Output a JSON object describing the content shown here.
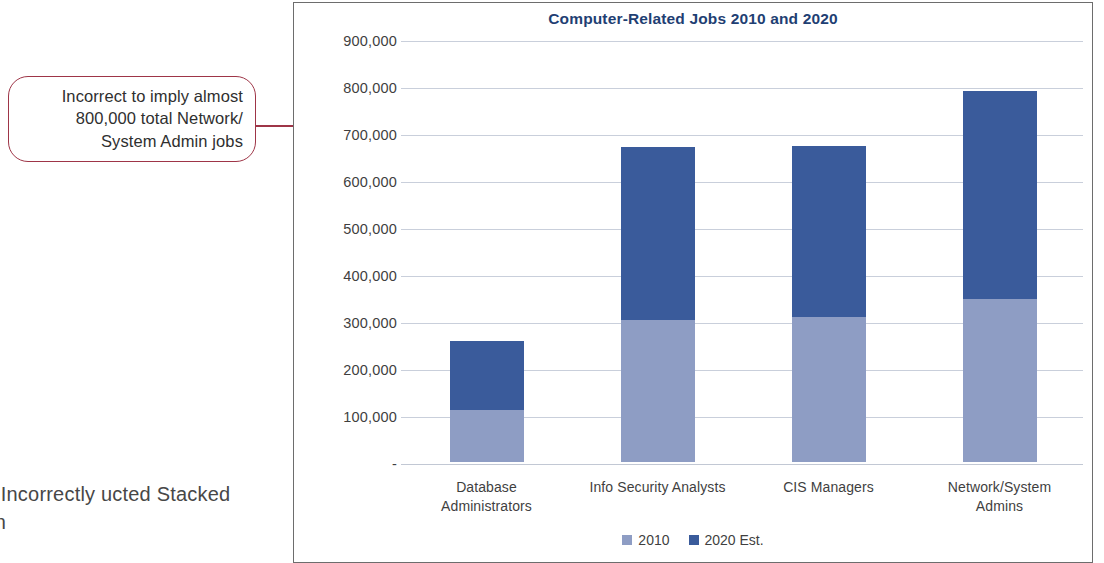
{
  "callout": {
    "name": "annotation-callout",
    "lines": [
      "Incorrect to imply almost",
      "800,000 total Network/",
      "System Admin jobs"
    ],
    "border_color": "#9e3547"
  },
  "figure_caption": {
    "number": "E 3.10",
    "text": " Incorrectly ucted Stacked Column",
    "full_visible": "E 3.10 Incorrectly ucted Stacked Column"
  },
  "chart_data": {
    "type": "bar",
    "subtype": "stacked-column",
    "title": "Computer-Related Jobs 2010 and 2020",
    "xlabel": "",
    "ylabel": "",
    "categories": [
      "Database Administrators",
      "Info Security Analysts",
      "CIS Managers",
      "Network/System Admins"
    ],
    "category_lines": [
      [
        "Database",
        "Administrators"
      ],
      [
        "Info Security Analysts",
        ""
      ],
      [
        "CIS Managers",
        ""
      ],
      [
        "Network/System",
        "Admins"
      ]
    ],
    "series": [
      {
        "name": "2010",
        "color": "#8e9dc4",
        "values": [
          110000,
          302000,
          308000,
          347000
        ]
      },
      {
        "name": "2020 Est.",
        "color": "#3a5b9b",
        "values": [
          148000,
          368000,
          365000,
          443000
        ]
      }
    ],
    "totals": [
      258000,
      670000,
      673000,
      790000
    ],
    "ylim": [
      0,
      900000
    ],
    "ytick_values": [
      900000,
      800000,
      700000,
      600000,
      500000,
      400000,
      300000,
      200000,
      100000,
      0
    ],
    "ytick_labels": [
      "900,000",
      "800,000",
      "700,000",
      "600,000",
      "500,000",
      "400,000",
      "300,000",
      "200,000",
      "100,000",
      "-"
    ],
    "grid": true,
    "legend_position": "bottom",
    "title_color": "#1f3f73",
    "grid_color": "#c9cfdb"
  }
}
